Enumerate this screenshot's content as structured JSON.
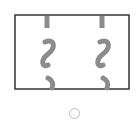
{
  "figure": {
    "frame_color": "#333333",
    "strand_color": "#8c8c8c",
    "strand_count": 2
  },
  "radio": {
    "selected": false,
    "border_color": "#bdbdbd"
  }
}
